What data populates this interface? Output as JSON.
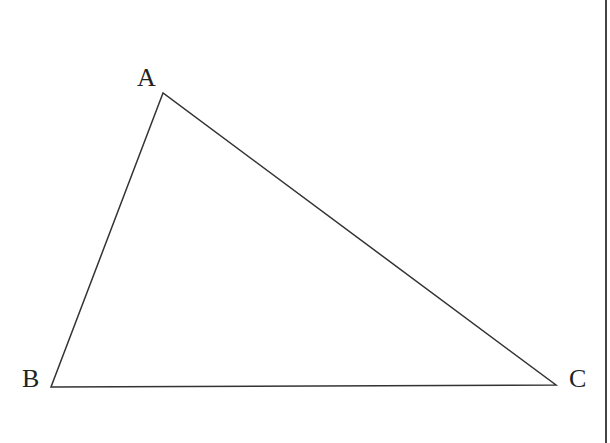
{
  "diagram": {
    "type": "triangle",
    "vertices": [
      {
        "label": "A",
        "x": 163,
        "y": 93
      },
      {
        "label": "B",
        "x": 51,
        "y": 387
      },
      {
        "label": "C",
        "x": 556,
        "y": 385
      }
    ],
    "edges": [
      [
        "A",
        "B"
      ],
      [
        "B",
        "C"
      ],
      [
        "C",
        "A"
      ]
    ],
    "stroke_color": "#333333"
  },
  "labels": {
    "a": "A",
    "b": "B",
    "c": "C"
  }
}
